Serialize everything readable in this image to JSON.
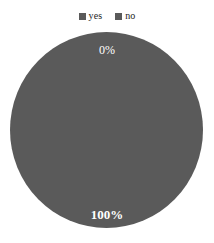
{
  "chart_data": {
    "type": "pie",
    "title": "",
    "categories": [
      "yes",
      "no"
    ],
    "values": [
      0,
      100
    ],
    "value_labels": [
      "0%",
      "100%"
    ],
    "legend": {
      "position": "top",
      "entries": [
        {
          "label": "yes",
          "color": "#5a5a5a",
          "value": 0,
          "value_label": "0%"
        },
        {
          "label": "no",
          "color": "#5a5a5a",
          "value": 100,
          "value_label": "100%"
        }
      ]
    },
    "colors": [
      "#5a5a5a",
      "#5a5a5a"
    ],
    "background": "#ffffff",
    "label_color": "#ffffff",
    "grid": false,
    "xlabel": "",
    "ylabel": ""
  },
  "legend": {
    "yes_label": "yes",
    "no_label": "no"
  },
  "pie": {
    "label_top": "0%",
    "label_bottom": "100%"
  }
}
